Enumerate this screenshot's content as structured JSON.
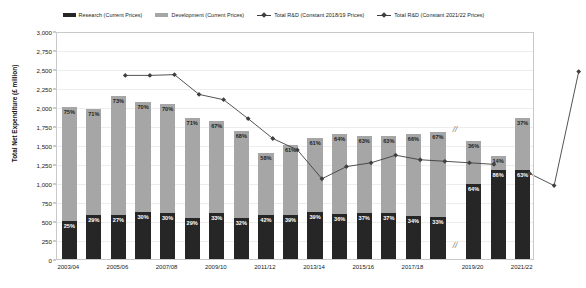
{
  "legend": {
    "items": [
      {
        "label": "Research (Current Prices)",
        "marker": "bar-swatch",
        "color": "#262626"
      },
      {
        "label": "Development (Current Prices)",
        "marker": "bar-swatch",
        "color": "#a6a6a6"
      },
      {
        "label": "Total R&D (Constant 2018/19 Prices)",
        "marker": "line-marker",
        "color": "#3f3f3f"
      },
      {
        "label": "Total R&D (Constant 2021/22 Prices)",
        "marker": "line-marker",
        "color": "#3f3f3f"
      }
    ]
  },
  "axes": {
    "ylabel": "Total Net Expenditure (£ million)",
    "yticks": [
      "0",
      "250",
      "500",
      "750",
      "1,000",
      "1,250",
      "1,500",
      "1,750",
      "2,000",
      "2,250",
      "2,500",
      "2,750",
      "3,000"
    ],
    "ymin": 0,
    "ymax": 3000,
    "xticks_visible": [
      "2003/04",
      "2005/06",
      "2007/08",
      "2009/10",
      "2011/12",
      "2013/14",
      "2015/16",
      "2017/18",
      "2019/20",
      "2021/22"
    ],
    "axis_break_symbol": "//"
  },
  "chart_data": {
    "type": "bar",
    "title": "",
    "xlabel": "",
    "ylabel": "Total Net Expenditure (£ million)",
    "ylim": [
      0,
      3000
    ],
    "grid": true,
    "legend_position": "top-center",
    "categories": [
      "2003/04",
      "2004/05",
      "2005/06",
      "2006/07",
      "2007/08",
      "2008/09",
      "2009/10",
      "2010/11",
      "2011/12",
      "2012/13",
      "2013/14",
      "2014/15",
      "2015/16",
      "2016/17",
      "2017/18",
      "2018/19",
      "2019/20",
      "2020/21",
      "2021/22"
    ],
    "series": [
      {
        "name": "Research (Current Prices)",
        "type": "bar-segment",
        "color": "#262626",
        "share_labels": [
          "25%",
          "29%",
          "27%",
          "30%",
          "30%",
          "29%",
          "33%",
          "32%",
          "42%",
          "39%",
          "39%",
          "36%",
          "37%",
          "37%",
          "34%",
          "33%",
          "64%",
          "86%",
          "63%"
        ],
        "values": [
          500,
          575,
          580,
          620,
          610,
          540,
          600,
          540,
          585,
          585,
          620,
          590,
          600,
          600,
          560,
          550,
          990,
          1170,
          1165
        ]
      },
      {
        "name": "Development (Current Prices)",
        "type": "bar-segment",
        "color": "#a6a6a6",
        "share_labels": [
          "75%",
          "71%",
          "73%",
          "70%",
          "70%",
          "71%",
          "67%",
          "68%",
          "58%",
          "61%",
          "61%",
          "64%",
          "63%",
          "63%",
          "66%",
          "67%",
          "36%",
          "14%",
          "37%"
        ],
        "values": [
          1500,
          1405,
          1570,
          1450,
          1425,
          1320,
          1220,
          1150,
          810,
          915,
          970,
          1050,
          1020,
          1020,
          1090,
          1115,
          560,
          190,
          685
        ]
      },
      {
        "name": "Total R&D (Constant 2018/19 Prices)",
        "type": "line",
        "color": "#3f3f3f",
        "values": [
          2850,
          2850,
          2860,
          2600,
          2530,
          2280,
          2020,
          1870,
          1490,
          1650,
          1700,
          1800,
          1740,
          1720,
          1700,
          1680,
          null,
          null,
          null
        ]
      },
      {
        "name": "Total R&D (Constant 2021/22 Prices)",
        "type": "line",
        "color": "#3f3f3f",
        "values": [
          null,
          null,
          null,
          null,
          null,
          null,
          null,
          null,
          null,
          null,
          null,
          null,
          null,
          null,
          null,
          null,
          1560,
          1400,
          2900
        ]
      }
    ],
    "bar_totals": [
      2000,
      1980,
      2150,
      2070,
      2035,
      1860,
      1820,
      1690,
      1395,
      1500,
      1590,
      1640,
      1620,
      1620,
      1650,
      1665,
      1550,
      1360,
      1850
    ]
  }
}
